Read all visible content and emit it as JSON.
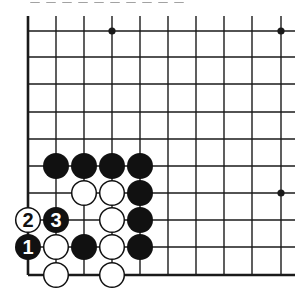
{
  "diagram": {
    "type": "go-board-fragment",
    "caption_visible": "cut off at top (illegible)",
    "grid": {
      "columns_x": [
        28,
        56,
        84,
        112,
        140,
        168,
        196,
        224,
        252,
        281
      ],
      "rows_y": [
        31,
        57,
        84,
        112,
        139,
        166,
        193,
        220,
        247,
        275
      ],
      "line_extend_right_to": 295,
      "line_extend_top_to": 16,
      "left_edge_is_board_edge": true,
      "bottom_edge_is_board_edge": true,
      "line_color": "#1a1a1a"
    },
    "star_points": [
      {
        "col": 3,
        "row": 0
      },
      {
        "col": 9,
        "row": 0
      },
      {
        "col": 9,
        "row": 6
      }
    ],
    "stones": [
      {
        "color": "black",
        "col": 1,
        "row": 5,
        "label": ""
      },
      {
        "color": "black",
        "col": 2,
        "row": 5,
        "label": ""
      },
      {
        "color": "black",
        "col": 3,
        "row": 5,
        "label": ""
      },
      {
        "color": "black",
        "col": 4,
        "row": 5,
        "label": ""
      },
      {
        "color": "white",
        "col": 2,
        "row": 6,
        "label": ""
      },
      {
        "color": "white",
        "col": 3,
        "row": 6,
        "label": ""
      },
      {
        "color": "black",
        "col": 4,
        "row": 6,
        "label": ""
      },
      {
        "color": "white",
        "col": 0,
        "row": 7,
        "label": "2"
      },
      {
        "color": "black",
        "col": 1,
        "row": 7,
        "label": "3"
      },
      {
        "color": "white",
        "col": 3,
        "row": 7,
        "label": ""
      },
      {
        "color": "black",
        "col": 4,
        "row": 7,
        "label": ""
      },
      {
        "color": "black",
        "col": 0,
        "row": 8,
        "label": "1"
      },
      {
        "color": "white",
        "col": 1,
        "row": 8,
        "label": ""
      },
      {
        "color": "black",
        "col": 2,
        "row": 8,
        "label": ""
      },
      {
        "color": "white",
        "col": 3,
        "row": 8,
        "label": ""
      },
      {
        "color": "black",
        "col": 4,
        "row": 8,
        "label": ""
      },
      {
        "color": "white",
        "col": 1,
        "row": 9,
        "label": ""
      },
      {
        "color": "white",
        "col": 3,
        "row": 9,
        "label": ""
      }
    ],
    "move_labels": [
      "1",
      "2",
      "3"
    ],
    "colors": {
      "black_stone": "#111111",
      "white_stone": "#ffffff",
      "stone_outline": "#111111",
      "background": "#ffffff"
    }
  }
}
